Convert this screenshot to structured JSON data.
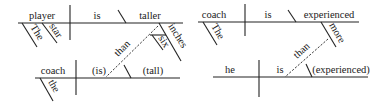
{
  "diagrams": [
    {
      "main_clause": {
        "subject": "player",
        "verb": "is",
        "complement": "taller"
      },
      "subject_modifiers": [
        "The",
        "star"
      ],
      "complement_modifier": "inches",
      "complement_modifier_modifier": "six",
      "connector": "than",
      "sub_clause": {
        "subject": "coach",
        "verb": "(is)",
        "complement": "(tall)"
      },
      "sub_subject_modifier": "the"
    },
    {
      "main_clause": {
        "subject": "coach",
        "verb": "is",
        "complement": "experienced"
      },
      "subject_modifiers": [
        "The"
      ],
      "complement_modifier": "more",
      "connector": "than",
      "sub_clause": {
        "subject": "he",
        "verb": "is",
        "complement": "(experienced)"
      }
    }
  ]
}
